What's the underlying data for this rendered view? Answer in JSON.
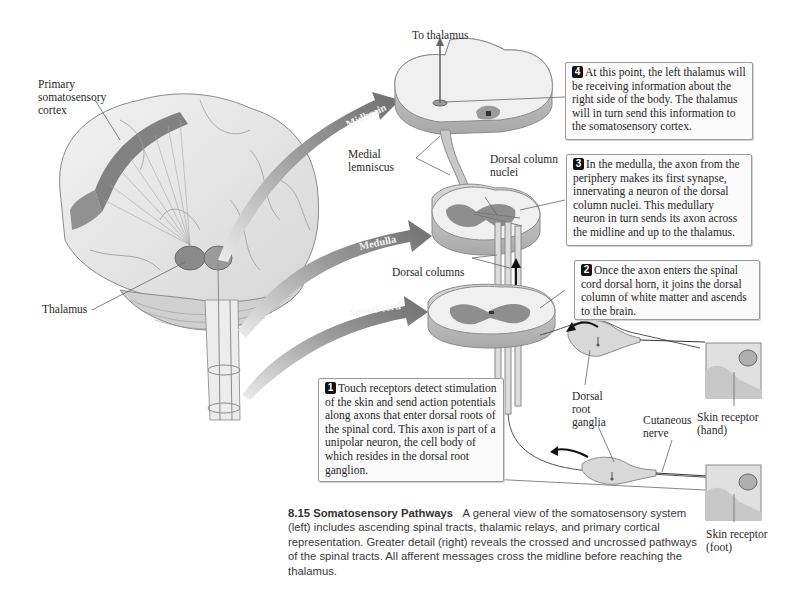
{
  "figure": {
    "number": "8.15",
    "title": "Somatosensory Pathways",
    "caption": "A general view of the somatosensory system (left) includes ascending spinal tracts, thalamic relays, and primary cortical representation. Greater detail (right) reveals the crossed and uncrossed pathways of the spinal tracts. All afferent messages cross the midline before reaching the thalamus."
  },
  "labels": {
    "primary_cortex": [
      "Primary",
      "somatosensory",
      "cortex"
    ],
    "thalamus": "Thalamus",
    "to_thalamus": "To thalamus",
    "medial_lemniscus": [
      "Medial",
      "lemniscus"
    ],
    "dorsal_column_nuclei": [
      "Dorsal column",
      "nuclei"
    ],
    "dorsal_columns": "Dorsal columns",
    "dorsal_root_ganglia": [
      "Dorsal",
      "root",
      "ganglia"
    ],
    "cutaneous_nerve": [
      "Cutaneous",
      "nerve"
    ],
    "skin_receptor_hand": [
      "Skin receptor",
      "(hand)"
    ],
    "skin_receptor_foot": [
      "Skin receptor",
      "(foot)"
    ]
  },
  "level_arrows": [
    {
      "label": "Midbrain"
    },
    {
      "label": "Medulla"
    },
    {
      "label": "Spinal cord"
    }
  ],
  "steps": [
    {
      "number": "1",
      "text": "Touch receptors detect stimulation of the skin and send action potentials along axons that enter dorsal roots of the spinal cord. This axon is part of a unipolar neuron, the cell body of which resides in the dorsal root ganglion."
    },
    {
      "number": "2",
      "text": "Once the axon enters the spinal cord dorsal horn, it joins the dorsal column of white matter and ascends to the brain."
    },
    {
      "number": "3",
      "text": "In the medulla, the axon from the periphery makes its first synapse, innervating a neuron of the dorsal column nuclei. This medullary neuron in turn sends its axon across the midline and up to the thalamus."
    },
    {
      "number": "4",
      "text": "At this point, the left thalamus will be receiving information about the right side of the body. The thalamus will in turn send this information to the somatosensory cortex."
    }
  ],
  "colors": {
    "arrow": "#7d7d7d",
    "gray_matter": "#8e8e8e",
    "cortex_band": "#6f6f6f",
    "tissue": "#ececec",
    "box_border": "#9a9a9a"
  }
}
